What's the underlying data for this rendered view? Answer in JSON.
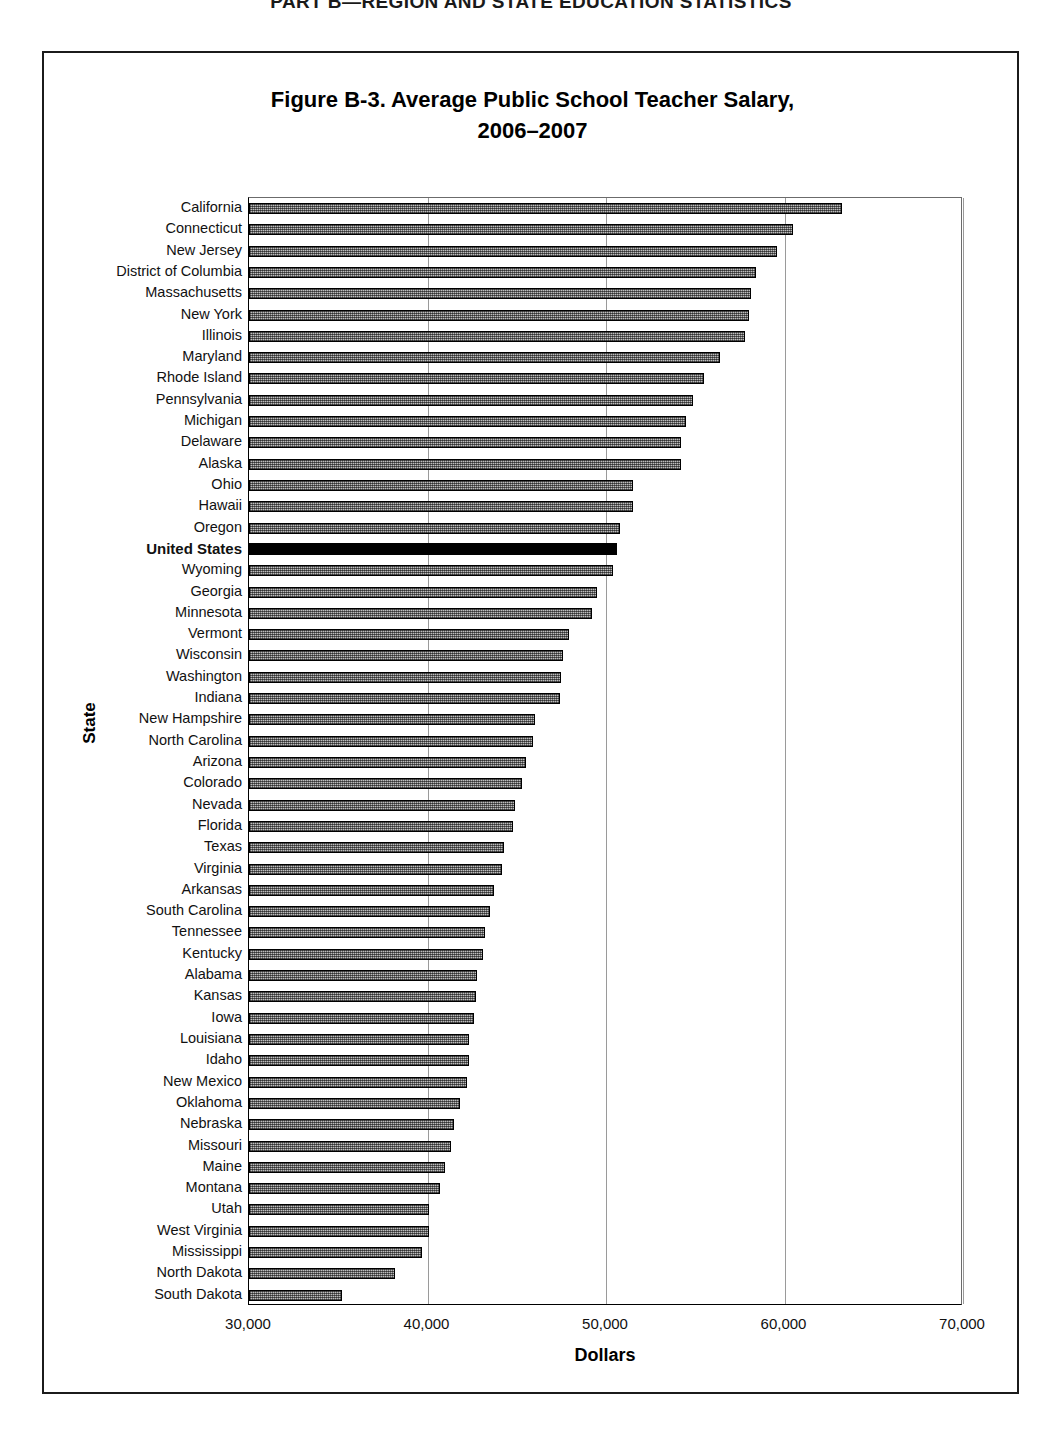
{
  "page_header": "PART B—REGION AND STATE EDUCATION STATISTICS",
  "figure": {
    "title_line1": "Figure B-3. Average Public School Teacher Salary,",
    "title_line2": "2006–2007"
  },
  "axis": {
    "y_title": "State",
    "x_title": "Dollars",
    "x_ticks": [
      "30,000",
      "40,000",
      "50,000",
      "60,000",
      "70,000"
    ]
  },
  "chart_data": {
    "type": "bar",
    "orientation": "horizontal",
    "title": "Figure B-3. Average Public School Teacher Salary, 2006–2007",
    "xlabel": "Dollars",
    "ylabel": "State",
    "xlim": [
      30000,
      70000
    ],
    "xticks": [
      30000,
      40000,
      50000,
      60000,
      70000
    ],
    "grid": true,
    "legend": null,
    "highlight_category": "United States",
    "highlight_color": "#000000",
    "bar_color": "#bcbcbc",
    "categories": [
      "California",
      "Connecticut",
      "New Jersey",
      "District of Columbia",
      "Massachusetts",
      "New York",
      "Illinois",
      "Maryland",
      "Rhode Island",
      "Pennsylvania",
      "Michigan",
      "Delaware",
      "Alaska",
      "Ohio",
      "Hawaii",
      "Oregon",
      "United States",
      "Wyoming",
      "Georgia",
      "Minnesota",
      "Vermont",
      "Wisconsin",
      "Washington",
      "Indiana",
      "New Hampshire",
      "North Carolina",
      "Arizona",
      "Colorado",
      "Nevada",
      "Florida",
      "Texas",
      "Virginia",
      "Arkansas",
      "South Carolina",
      "Tennessee",
      "Kentucky",
      "Alabama",
      "Kansas",
      "Iowa",
      "Louisiana",
      "Idaho",
      "New Mexico",
      "Oklahoma",
      "Nebraska",
      "Missouri",
      "Maine",
      "Montana",
      "Utah",
      "West Virginia",
      "Mississippi",
      "North Dakota",
      "South Dakota"
    ],
    "values": [
      63200,
      60500,
      59600,
      58400,
      58100,
      58000,
      57800,
      56400,
      55500,
      54900,
      54500,
      54200,
      54200,
      51500,
      51500,
      50800,
      50600,
      50400,
      49500,
      49200,
      47900,
      47600,
      47500,
      47400,
      46000,
      45900,
      45500,
      45300,
      44900,
      44800,
      44300,
      44200,
      43700,
      43500,
      43200,
      43100,
      42800,
      42700,
      42600,
      42300,
      42300,
      42200,
      41800,
      41500,
      41300,
      41000,
      40700,
      40100,
      40100,
      39700,
      38200,
      35200
    ]
  }
}
